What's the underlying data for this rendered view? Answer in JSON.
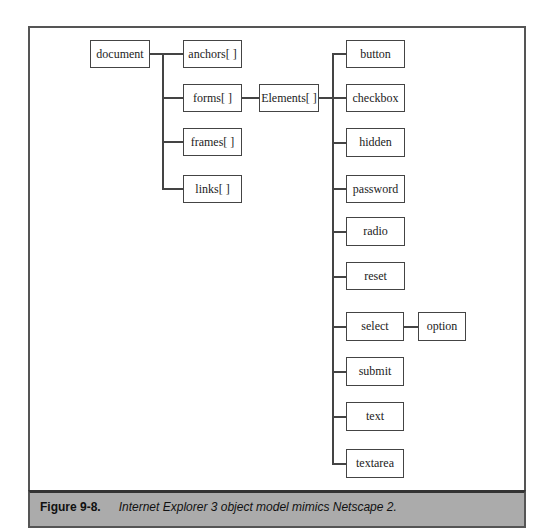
{
  "diagram": {
    "nodes": {
      "document": "document",
      "anchors": "anchors[ ]",
      "forms": "forms[ ]",
      "frames": "frames[ ]",
      "links": "links[ ]",
      "elements": "Elements[ ]",
      "button": "button",
      "checkbox": "checkbox",
      "hidden": "hidden",
      "password": "password",
      "radio": "radio",
      "reset": "reset",
      "select": "select",
      "option": "option",
      "submit": "submit",
      "text": "text",
      "textarea": "textarea"
    },
    "edges": [
      [
        "document",
        "anchors"
      ],
      [
        "document",
        "forms"
      ],
      [
        "document",
        "frames"
      ],
      [
        "document",
        "links"
      ],
      [
        "forms",
        "elements"
      ],
      [
        "elements",
        "button"
      ],
      [
        "elements",
        "checkbox"
      ],
      [
        "elements",
        "hidden"
      ],
      [
        "elements",
        "password"
      ],
      [
        "elements",
        "radio"
      ],
      [
        "elements",
        "reset"
      ],
      [
        "elements",
        "select"
      ],
      [
        "elements",
        "submit"
      ],
      [
        "elements",
        "text"
      ],
      [
        "elements",
        "textarea"
      ],
      [
        "select",
        "option"
      ]
    ]
  },
  "caption": {
    "label": "Figure 9-8.",
    "text": "Internet Explorer 3 object model mimics Netscape 2."
  }
}
